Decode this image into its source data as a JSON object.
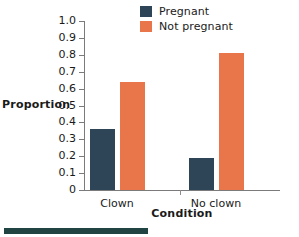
{
  "chart_data": {
    "type": "bar",
    "title": "",
    "xlabel": "Condition",
    "ylabel": "Proportion",
    "categories": [
      "Clown",
      "No clown"
    ],
    "series": [
      {
        "name": "Pregnant",
        "color": "#2e4457",
        "values": [
          0.36,
          0.19
        ]
      },
      {
        "name": "Not pregnant",
        "color": "#e8764a",
        "values": [
          0.64,
          0.81
        ]
      }
    ],
    "ylim": [
      0,
      1.0
    ],
    "ytick_labels": [
      "1.0",
      "0.9",
      "0.8",
      "0.7",
      "0.6",
      "0.5",
      "0.4",
      "0.3",
      "0.2",
      "0.1",
      "0"
    ],
    "ytick_values": [
      1.0,
      0.9,
      0.8,
      0.7,
      0.6,
      0.5,
      0.4,
      0.3,
      0.2,
      0.1,
      0
    ],
    "grid": false,
    "legend_position": "top-right"
  },
  "legend": {
    "entries": [
      {
        "label": "Pregnant",
        "color": "#2e4457"
      },
      {
        "label": "Not pregnant",
        "color": "#e8764a"
      }
    ]
  },
  "axes": {
    "y_title": "Proportion",
    "x_title": "Condition"
  },
  "colors": {
    "pregnant": "#2e4457",
    "not_pregnant": "#e8764a",
    "axis": "#7b7b7b",
    "footer_rule": "#1f4442"
  }
}
